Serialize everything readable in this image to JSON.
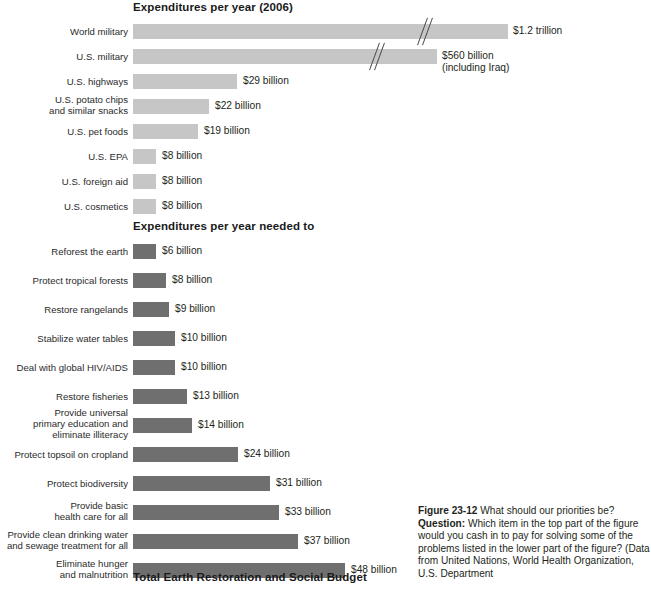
{
  "figure": {
    "top_section_title": "Expenditures per year (2006)",
    "middle_section_title": "Expenditures per year needed to",
    "bottom_section_title": "Total Earth Restoration and Social Budget"
  },
  "caption": {
    "figure_number": "Figure 23-12",
    "headline": "What should our priorities be?",
    "question_label": "Question:",
    "question_text": "Which item in the top part of the figure would you cash in to pay for solving some of the problems listed in the lower part of the figure? (Data from United Nations, World Health Organization, U.S. Department"
  },
  "colors": {
    "top_bar": "#c6c6c6",
    "bottom_bar": "#6f6f6f",
    "text": "#231f20",
    "break_mark": "#4a4a4a"
  },
  "chart_data": {
    "type": "bar",
    "title": "What should our priorities be?",
    "xlabel": "",
    "ylabel": "",
    "orientation": "horizontal",
    "grid": false,
    "legend": "none",
    "units": "US dollars per year",
    "note": "Top group bars for World military and U.S. military are drawn with an axis break (broken-bar slashes) because their values far exceed the plotted scale.",
    "panels": [
      {
        "name": "Expenditures per year (2006)",
        "bar_color": "#c6c6c6",
        "categories": [
          "World military",
          "U.S. military",
          "U.S. highways",
          "U.S. potato chips and similar snacks",
          "U.S. pet foods",
          "U.S. EPA",
          "U.S. foreign aid",
          "U.S. cosmetics"
        ],
        "values": [
          1200,
          560,
          29,
          22,
          19,
          8,
          8,
          8
        ],
        "value_labels": [
          "$1.2 trillion",
          "$560 billion\n(including Iraq)",
          "$29 billion",
          "$22 billion",
          "$19 billion",
          "$8 billion",
          "$8 billion",
          "$8 billion"
        ],
        "broken_axis": [
          true,
          true,
          false,
          false,
          false,
          false,
          false,
          false
        ]
      },
      {
        "name": "Expenditures per year needed to",
        "bar_color": "#6f6f6f",
        "categories": [
          "Reforest the earth",
          "Protect tropical forests",
          "Restore rangelands",
          "Stabilize water tables",
          "Deal with global HIV/AIDS",
          "Restore fisheries",
          "Provide universal primary education and eliminate illiteracy",
          "Protect topsoil on cropland",
          "Protect biodiversity",
          "Provide basic health care for all",
          "Provide clean drinking water and sewage treatment for all",
          "Eliminate hunger and malnutrition"
        ],
        "values": [
          6,
          8,
          9,
          10,
          10,
          13,
          14,
          24,
          31,
          33,
          37,
          48
        ],
        "value_labels": [
          "$6 billion",
          "$8 billion",
          "$9 billion",
          "$10 billion",
          "$10 billion",
          "$13 billion",
          "$14 billion",
          "$24 billion",
          "$31 billion",
          "$33 billion",
          "$37 billion",
          "$48 billion"
        ],
        "broken_axis": [
          false,
          false,
          false,
          false,
          false,
          false,
          false,
          false,
          false,
          false,
          false,
          false
        ]
      }
    ]
  },
  "rows_top": [
    {
      "label": "World military",
      "lines": 1,
      "bar_w": 375,
      "value": "$1.2 trillion",
      "value_x": 513,
      "break_x": 286,
      "top": 24
    },
    {
      "label": "U.S. military",
      "lines": 1,
      "bar_w": 304,
      "value": "$560 billion\n(including Iraq)",
      "value_x": 442,
      "break_x": 238,
      "top": 49
    },
    {
      "label": "U.S. highways",
      "lines": 1,
      "bar_w": 104,
      "value": "$29 billion",
      "value_x": 243,
      "break_x": null,
      "top": 74
    },
    {
      "label": "U.S. potato chips\nand similar snacks",
      "lines": 2,
      "bar_w": 76,
      "value": "$22 billion",
      "value_x": 215,
      "break_x": null,
      "top": 99
    },
    {
      "label": "U.S. pet foods",
      "lines": 1,
      "bar_w": 65,
      "value": "$19 billion",
      "value_x": 204,
      "break_x": null,
      "top": 124
    },
    {
      "label": "U.S. EPA",
      "lines": 1,
      "bar_w": 23,
      "value": "$8 billion",
      "value_x": 162,
      "break_x": null,
      "top": 149
    },
    {
      "label": "U.S. foreign aid",
      "lines": 1,
      "bar_w": 23,
      "value": "$8 billion",
      "value_x": 162,
      "break_x": null,
      "top": 174
    },
    {
      "label": "U.S. cosmetics",
      "lines": 1,
      "bar_w": 23,
      "value": "$8 billion",
      "value_x": 162,
      "break_x": null,
      "top": 199
    }
  ],
  "rows_bottom": [
    {
      "label": "Reforest the earth",
      "lines": 1,
      "bar_w": 23,
      "value": "$6 billion",
      "value_x": 162,
      "top": 244
    },
    {
      "label": "Protect tropical forests",
      "lines": 1,
      "bar_w": 33,
      "value": "$8 billion",
      "value_x": 172,
      "top": 273
    },
    {
      "label": "Restore rangelands",
      "lines": 1,
      "bar_w": 36,
      "value": "$9 billion",
      "value_x": 175,
      "top": 302
    },
    {
      "label": "Stabilize water tables",
      "lines": 1,
      "bar_w": 42,
      "value": "$10 billion",
      "value_x": 181,
      "top": 331
    },
    {
      "label": "Deal with global HIV/AIDS",
      "lines": 1,
      "bar_w": 42,
      "value": "$10 billion",
      "value_x": 181,
      "top": 360
    },
    {
      "label": "Restore fisheries",
      "lines": 1,
      "bar_w": 54,
      "value": "$13 billion",
      "value_x": 193,
      "top": 389
    },
    {
      "label": "Provide universal\nprimary education and\neliminate illiteracy",
      "lines": 3,
      "bar_w": 59,
      "value": "$14 billion",
      "value_x": 198,
      "top": 418
    },
    {
      "label": "Protect topsoil on cropland",
      "lines": 1,
      "bar_w": 105,
      "value": "$24 billion",
      "value_x": 244,
      "top": 447
    },
    {
      "label": "Protect biodiversity",
      "lines": 1,
      "bar_w": 137,
      "value": "$31 billion",
      "value_x": 276,
      "top": 476
    },
    {
      "label": "Provide basic\nhealth care for all",
      "lines": 2,
      "bar_w": 146,
      "value": "$33 billion",
      "value_x": 285,
      "top": 505
    },
    {
      "label": "Provide clean drinking water\nand sewage treatment for all",
      "lines": 2,
      "bar_w": 165,
      "value": "$37 billion",
      "value_x": 304,
      "top": 534
    },
    {
      "label": "Eliminate hunger\nand malnutrition",
      "lines": 2,
      "bar_w": 212,
      "value": "$48 billion",
      "value_x": 351,
      "top": 563
    }
  ]
}
